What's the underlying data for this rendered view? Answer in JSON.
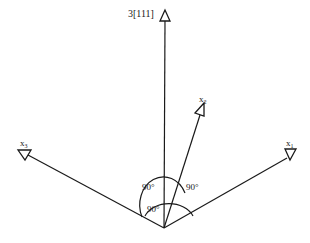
{
  "diagram": {
    "axes": {
      "vertical": {
        "label": "3[111]"
      },
      "x1": {
        "label": "x",
        "subscript": "1"
      },
      "x2": {
        "label": "x",
        "subscript": "2"
      },
      "x3": {
        "label": "x",
        "subscript": "3"
      }
    },
    "angles": {
      "upper_left": "90°",
      "upper_right": "90°",
      "lower": "90°"
    },
    "colors": {
      "line": "#1a1a1a",
      "background": "#ffffff"
    }
  }
}
